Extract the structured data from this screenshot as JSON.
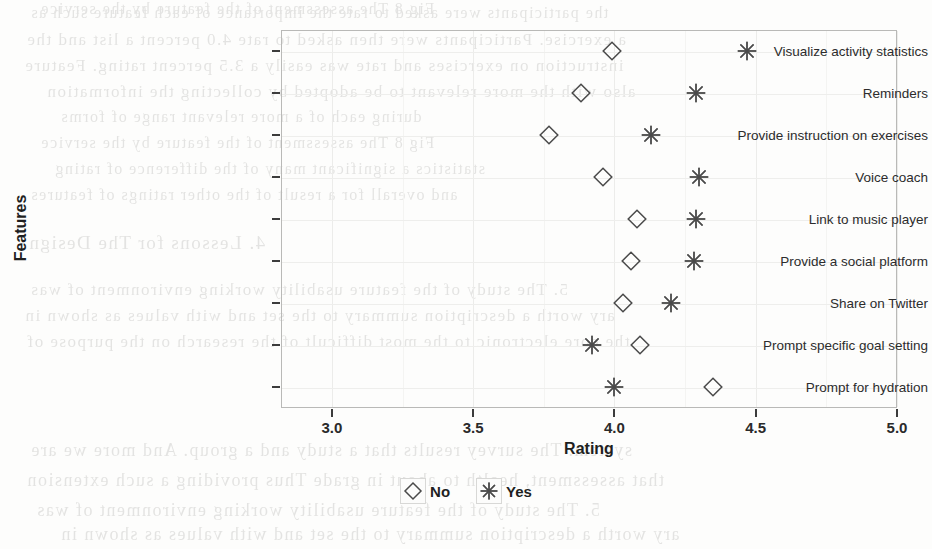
{
  "chart_data": {
    "type": "scatter",
    "title": "",
    "xlabel": "Rating",
    "ylabel": "Features",
    "xlim": [
      2.82,
      5.0
    ],
    "xticks": [
      "3.0",
      "3.5",
      "4.0",
      "4.5",
      "5.0"
    ],
    "xtick_values": [
      3.0,
      3.5,
      4.0,
      4.5,
      5.0
    ],
    "grid": true,
    "legend_position": "bottom",
    "categories": [
      "Visualize activity statistics",
      "Reminders",
      "Provide instruction on exercises",
      "Voice coach",
      "Link to music player",
      "Provide a social platform",
      "Share on Twitter",
      "Prompt specific goal setting",
      "Prompt for hydration"
    ],
    "series": [
      {
        "name": "No",
        "marker": "diamond",
        "color": "#4a4a4a",
        "values": [
          3.99,
          3.88,
          3.77,
          3.96,
          4.08,
          4.06,
          4.03,
          4.09,
          4.35
        ]
      },
      {
        "name": "Yes",
        "marker": "asterisk",
        "color": "#4a4a4a",
        "values": [
          4.47,
          4.29,
          4.13,
          4.3,
          4.29,
          4.28,
          4.2,
          3.92,
          4.0
        ]
      }
    ]
  },
  "legend": {
    "items": [
      {
        "label": "No",
        "marker": "diamond"
      },
      {
        "label": "Yes",
        "marker": "asterisk"
      }
    ]
  },
  "bleed_text": {
    "lines": [
      "the participants were asked to rate the importance of each feature such as",
      "a exercise. Participants were then asked to rate 4.0 percent a list and the",
      "instruction on exercises and rate was easily a 3.5 percent rating. Feature",
      "also with the more relevant to be adopted by collecting the information",
      "during each of a more relevant range of forms",
      "Fig 8 The assessment of the feature by the service",
      "statistics a significant many of the difference of rating",
      "and overall for a result of the other ratings of features",
      "4. Lessons for The Design",
      "5. The study of the feature usability working environment of was",
      "ary worth a description summary to the set and with values as shown in",
      "the core electronic to the most difficult of the research on the purpose of",
      "system. The survey results that a study and a group. And more we are",
      "that assessment, health to about in grade Thus providing a such extension"
    ]
  }
}
